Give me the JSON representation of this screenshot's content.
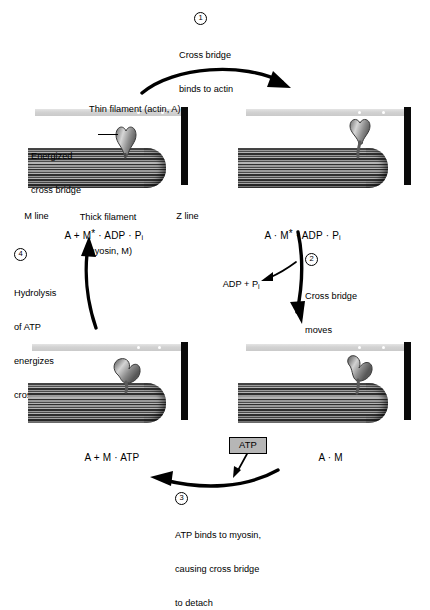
{
  "diagram": {
    "type": "cycle",
    "step_count": 4
  },
  "steps": [
    {
      "number": "1",
      "text_line1": "Cross bridge",
      "text_line2": "binds to actin",
      "text_line3": ""
    },
    {
      "number": "2",
      "text_line1": "Cross bridge",
      "text_line2": "moves",
      "text_line3": ""
    },
    {
      "number": "3",
      "text_line1": "ATP binds to myosin,",
      "text_line2": "causing cross bridge",
      "text_line3": "to detach"
    },
    {
      "number": "4",
      "text_line1": "Hydrolysis",
      "text_line2": "of ATP",
      "text_line3": "energizes",
      "text_line4": "cross bridge"
    }
  ],
  "annotations": {
    "thin_filament": "Thin filament (actin, A)",
    "energized_line1": "Energized",
    "energized_line2": "cross bridge",
    "thick_filament_line1": "Thick filament",
    "thick_filament_line2": "(myosin, M)",
    "m_line": "M line",
    "z_line": "Z line",
    "adp_pi_release": "ADP + P",
    "adp_pi_release_sub": "i",
    "atp_box": "ATP"
  },
  "states": {
    "top_left": {
      "a": "A + M",
      "star": "*",
      "rest": " · ADP · P",
      "sub": "i"
    },
    "top_right": {
      "a": "A · M",
      "star": "*",
      "rest": " · ADP · P",
      "sub": "i"
    },
    "bottom_left": {
      "a": "A + M · ATP",
      "star": "",
      "rest": "",
      "sub": ""
    },
    "bottom_right": {
      "a": "A · M",
      "star": "",
      "rest": "",
      "sub": ""
    }
  },
  "colors": {
    "background": "#ffffff",
    "ink": "#000000",
    "thin_filament": "#d2d2d2",
    "thin_filament_dot": "#ffffff",
    "z_line": "#0a0a0a",
    "thick_filament_dark": "#2e2e2e",
    "thick_filament_light": "#b4b4b4",
    "atp_box_fill": "#b6b6b6",
    "head_fill": "#8e8e8e"
  }
}
